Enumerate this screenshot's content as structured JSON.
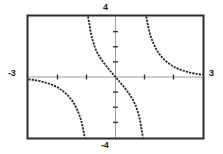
{
  "graph": {
    "labels": {
      "x_min": "-3",
      "x_max": "3",
      "y_max": "4",
      "y_min": "-4"
    },
    "style": {
      "frame_color": "#2b2b2b",
      "axis_color": "#3a3a3a",
      "curve_color": "#262626",
      "background": "#ffffff"
    }
  },
  "chart_data": {
    "type": "line",
    "title": "",
    "xlabel": "",
    "ylabel": "",
    "xlim": [
      -3,
      3
    ],
    "ylim": [
      -4,
      4
    ],
    "xticks": [
      -2,
      -1,
      1,
      2
    ],
    "yticks": [
      -3,
      -2,
      -1,
      1,
      2,
      3
    ],
    "grid": false,
    "legend": null,
    "axes_style": "dotted",
    "asymptotes": {
      "vertical": [
        -1,
        1
      ]
    },
    "series": [
      {
        "name": "branch-left",
        "comment": "x from -3 to -1, decreasing from near y=0 down to -4",
        "x": [
          -3.0,
          -2.8,
          -2.6,
          -2.4,
          -2.2,
          -2.0,
          -1.8,
          -1.65,
          -1.5,
          -1.4,
          -1.3,
          -1.22,
          -1.16,
          -1.12,
          -1.09,
          -1.07,
          -1.05
        ],
        "y": [
          -0.15,
          -0.2,
          -0.28,
          -0.38,
          -0.5,
          -0.68,
          -0.95,
          -1.2,
          -1.55,
          -1.85,
          -2.25,
          -2.65,
          -3.05,
          -3.4,
          -3.7,
          -3.9,
          -4.0
        ]
      },
      {
        "name": "branch-middle",
        "comment": "x from -1 to 1 through origin, decreasing, asymptotic both ends",
        "x": [
          -0.95,
          -0.93,
          -0.9,
          -0.86,
          -0.8,
          -0.7,
          -0.6,
          -0.45,
          -0.3,
          -0.15,
          0.0,
          0.15,
          0.3,
          0.45,
          0.6,
          0.7,
          0.8,
          0.86,
          0.9,
          0.93,
          0.95
        ],
        "y": [
          4.0,
          3.8,
          3.5,
          3.0,
          2.5,
          1.9,
          1.5,
          1.05,
          0.68,
          0.33,
          0.0,
          -0.33,
          -0.68,
          -1.05,
          -1.5,
          -1.9,
          -2.5,
          -3.0,
          -3.5,
          -3.8,
          -4.0
        ]
      },
      {
        "name": "branch-right",
        "comment": "x from 1 to 3, decreasing from +4 toward y=0",
        "x": [
          1.05,
          1.07,
          1.09,
          1.12,
          1.16,
          1.22,
          1.3,
          1.4,
          1.5,
          1.65,
          1.8,
          2.0,
          2.2,
          2.4,
          2.6,
          2.8,
          3.0
        ],
        "y": [
          4.0,
          3.9,
          3.7,
          3.4,
          3.05,
          2.65,
          2.25,
          1.85,
          1.55,
          1.2,
          0.95,
          0.68,
          0.5,
          0.38,
          0.28,
          0.2,
          0.15
        ]
      }
    ]
  }
}
